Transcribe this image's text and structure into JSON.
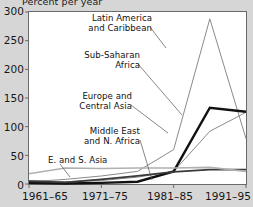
{
  "axis": {
    "ylabel": "Percent per year",
    "yticks": [
      "300",
      "250",
      "200",
      "150",
      "100",
      "50",
      "0"
    ],
    "xticks": [
      "1961–65",
      "1971–75",
      "1981–85",
      "1991–95"
    ]
  },
  "labels": {
    "latin_america": "Latin America\nand Caribbean",
    "latin_america_l1": "Latin America",
    "latin_america_l2": "and Caribbean",
    "sub_saharan_l1": "Sub-Saharan",
    "sub_saharan_l2": "Africa",
    "europe_l1": "Europe and",
    "europe_l2": "Central Asia",
    "mena_l1": "Middle East",
    "mena_l2": "and N. Africa",
    "es_asia": "E. and S. Asia"
  },
  "colors": {
    "latin_america": "#8a8a8a",
    "sub_saharan": "#8a8a8a",
    "europe_central_asia": "#111111",
    "middle_east_n_africa": "#3a3a3a",
    "e_s_asia": "#b0b0b0",
    "axis": "#6a6a6a",
    "text": "#161616",
    "background": "#d6d6d6",
    "plot": "#ffffff"
  },
  "chart_data": {
    "type": "line",
    "title": "",
    "xlabel": "",
    "ylabel": "Percent per year",
    "ylim": [
      0,
      300
    ],
    "grid": false,
    "legend": "inline-annotations",
    "x": [
      "1961–65",
      "1966–70",
      "1971–75",
      "1976–80",
      "1981–85",
      "1986–90",
      "1991–95"
    ],
    "xtick_labels": [
      "1961–65",
      "1971–75",
      "1981–85",
      "1991–95"
    ],
    "series": [
      {
        "name": "Latin America and Caribbean",
        "color": "#8a8a8a",
        "width": 1.0,
        "values": [
          4,
          8,
          14,
          22,
          60,
          288,
          79
        ]
      },
      {
        "name": "Sub-Saharan Africa",
        "color": "#8a8a8a",
        "width": 1.0,
        "values": [
          6,
          4,
          6,
          12,
          22,
          92,
          125
        ]
      },
      {
        "name": "Europe and Central Asia",
        "color": "#111111",
        "width": 2.4,
        "values": [
          2,
          1,
          2,
          4,
          22,
          133,
          126
        ]
      },
      {
        "name": "Middle East and N. Africa",
        "color": "#3a3a3a",
        "width": 1.8,
        "values": [
          5,
          3,
          8,
          14,
          21,
          25,
          25
        ]
      },
      {
        "name": "E. and S. Asia",
        "color": "#b0b0b0",
        "width": 1.6,
        "values": [
          18,
          28,
          27,
          28,
          28,
          29,
          22
        ]
      }
    ]
  }
}
